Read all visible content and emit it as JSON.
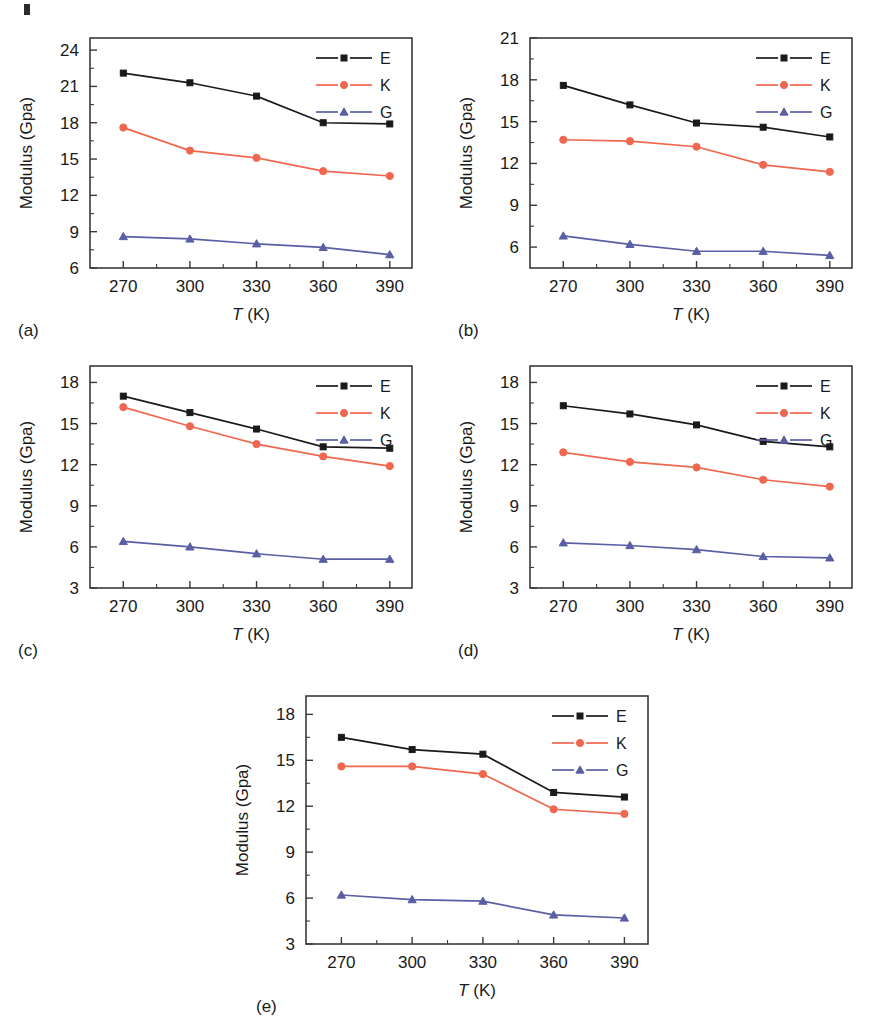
{
  "figure": {
    "panel_count": 5,
    "axis": {
      "ylabel": "Modulus (Gpa)",
      "xlabel_symbol": "T",
      "xlabel_unit": "(K)"
    },
    "series_colors": {
      "E": "#1a1a1a",
      "K": "#f0674f",
      "G": "#5a5fa5"
    },
    "series_markers": {
      "E": "square",
      "K": "circle",
      "G": "triangle"
    }
  },
  "chart_data": [
    {
      "type": "line",
      "panel": "(a)",
      "title": "",
      "xlabel": "T (K)",
      "ylabel": "Modulus (Gpa)",
      "x": [
        270,
        300,
        330,
        360,
        390
      ],
      "xticks": [
        270,
        300,
        330,
        360,
        390
      ],
      "xlim": [
        255,
        400
      ],
      "yticks": [
        6,
        9,
        12,
        15,
        18,
        21,
        24
      ],
      "ylim": [
        6,
        25
      ],
      "grid": false,
      "legend_position": "top-right",
      "series": [
        {
          "name": "E",
          "values": [
            22.1,
            21.3,
            20.2,
            18.0,
            17.9
          ]
        },
        {
          "name": "K",
          "values": [
            17.6,
            15.7,
            15.1,
            14.0,
            13.6
          ]
        },
        {
          "name": "G",
          "values": [
            8.6,
            8.4,
            8.0,
            7.7,
            7.1
          ]
        }
      ]
    },
    {
      "type": "line",
      "panel": "(b)",
      "title": "",
      "xlabel": "T (K)",
      "ylabel": "Modulus (Gpa)",
      "x": [
        270,
        300,
        330,
        360,
        390
      ],
      "xticks": [
        270,
        300,
        330,
        360,
        390
      ],
      "xlim": [
        255,
        400
      ],
      "yticks": [
        6,
        9,
        12,
        15,
        18,
        21
      ],
      "ylim": [
        4.5,
        21
      ],
      "grid": false,
      "legend_position": "top-right",
      "series": [
        {
          "name": "E",
          "values": [
            17.6,
            16.2,
            14.9,
            14.6,
            13.9
          ]
        },
        {
          "name": "K",
          "values": [
            13.7,
            13.6,
            13.2,
            11.9,
            11.4
          ]
        },
        {
          "name": "G",
          "values": [
            6.8,
            6.2,
            5.7,
            5.7,
            5.4
          ]
        }
      ]
    },
    {
      "type": "line",
      "panel": "(c)",
      "title": "",
      "xlabel": "T (K)",
      "ylabel": "Modulus (Gpa)",
      "x": [
        270,
        300,
        330,
        360,
        390
      ],
      "xticks": [
        270,
        300,
        330,
        360,
        390
      ],
      "xlim": [
        255,
        400
      ],
      "yticks": [
        3,
        6,
        9,
        12,
        15,
        18
      ],
      "ylim": [
        3,
        19.2
      ],
      "grid": false,
      "legend_position": "top-right",
      "series": [
        {
          "name": "E",
          "values": [
            17.0,
            15.8,
            14.6,
            13.3,
            13.2
          ]
        },
        {
          "name": "K",
          "values": [
            16.2,
            14.8,
            13.5,
            12.6,
            11.9
          ]
        },
        {
          "name": "G",
          "values": [
            6.4,
            6.0,
            5.5,
            5.1,
            5.1
          ]
        }
      ]
    },
    {
      "type": "line",
      "panel": "(d)",
      "title": "",
      "xlabel": "T (K)",
      "ylabel": "Modulus (Gpa)",
      "x": [
        270,
        300,
        330,
        360,
        390
      ],
      "xticks": [
        270,
        300,
        330,
        360,
        390
      ],
      "xlim": [
        255,
        400
      ],
      "yticks": [
        3,
        6,
        9,
        12,
        15,
        18
      ],
      "ylim": [
        3,
        19.2
      ],
      "grid": false,
      "legend_position": "top-right",
      "series": [
        {
          "name": "E",
          "values": [
            16.3,
            15.7,
            14.9,
            13.7,
            13.3
          ]
        },
        {
          "name": "K",
          "values": [
            12.9,
            12.2,
            11.8,
            10.9,
            10.4
          ]
        },
        {
          "name": "G",
          "values": [
            6.3,
            6.1,
            5.8,
            5.3,
            5.2
          ]
        }
      ]
    },
    {
      "type": "line",
      "panel": "(e)",
      "title": "",
      "xlabel": "T (K)",
      "ylabel": "Modulus (Gpa)",
      "x": [
        270,
        300,
        330,
        360,
        390
      ],
      "xticks": [
        270,
        300,
        330,
        360,
        390
      ],
      "xlim": [
        255,
        400
      ],
      "yticks": [
        3,
        6,
        9,
        12,
        15,
        18
      ],
      "ylim": [
        3,
        19.2
      ],
      "grid": false,
      "legend_position": "top-right",
      "series": [
        {
          "name": "E",
          "values": [
            16.5,
            15.7,
            15.4,
            12.9,
            12.6
          ]
        },
        {
          "name": "K",
          "values": [
            14.6,
            14.6,
            14.1,
            11.8,
            11.5
          ]
        },
        {
          "name": "G",
          "values": [
            6.2,
            5.9,
            5.8,
            4.9,
            4.7
          ]
        }
      ]
    }
  ],
  "panel_layout": [
    {
      "panel": "(a)",
      "left": 0,
      "top": 14,
      "width": 430,
      "height": 330
    },
    {
      "panel": "(b)",
      "left": 440,
      "top": 14,
      "width": 430,
      "height": 330
    },
    {
      "panel": "(c)",
      "left": 0,
      "top": 342,
      "width": 430,
      "height": 322
    },
    {
      "panel": "(d)",
      "left": 440,
      "top": 342,
      "width": 430,
      "height": 322
    },
    {
      "panel": "(e)",
      "left": 216,
      "top": 672,
      "width": 450,
      "height": 348
    }
  ]
}
